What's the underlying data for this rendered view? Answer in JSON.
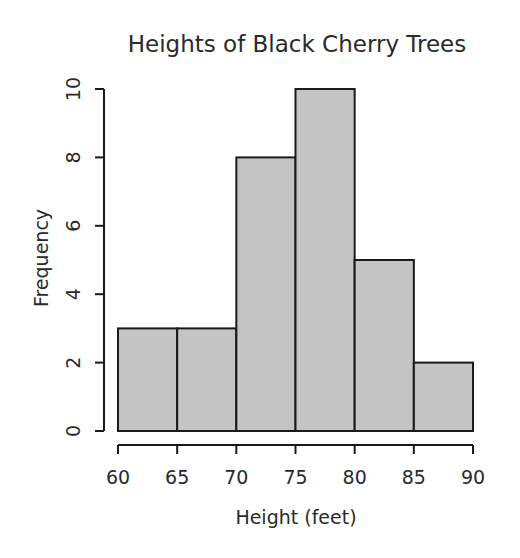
{
  "chart_data": {
    "type": "bar",
    "subtype": "histogram",
    "title": "Heights of Black Cherry Trees",
    "xlabel": "Height (feet)",
    "ylabel": "Frequency",
    "bins": [
      [
        60,
        65
      ],
      [
        65,
        70
      ],
      [
        70,
        75
      ],
      [
        75,
        80
      ],
      [
        80,
        85
      ],
      [
        85,
        90
      ]
    ],
    "categories": [
      "60-65",
      "65-70",
      "70-75",
      "75-80",
      "80-85",
      "85-90"
    ],
    "values": [
      3,
      3,
      8,
      10,
      5,
      2
    ],
    "xlim": [
      60,
      90
    ],
    "ylim": [
      0,
      10
    ],
    "xticks": [
      "60",
      "65",
      "70",
      "75",
      "80",
      "85",
      "90"
    ],
    "yticks": [
      "0",
      "2",
      "4",
      "6",
      "8",
      "10"
    ],
    "grid": false,
    "legend": null,
    "bar_color": "#c4c4c4",
    "edge_color": "#1a1a1a"
  }
}
